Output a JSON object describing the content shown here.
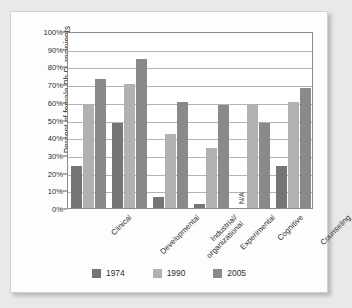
{
  "chart_data": {
    "type": "bar",
    "title": "",
    "xlabel": "",
    "ylabel": "Percent of female Ph.D. recipients",
    "ylim": [
      0,
      100
    ],
    "ytick_labels": [
      "100%",
      "90%",
      "80%",
      "70%",
      "60%",
      "50%",
      "40%",
      "30%",
      "20%",
      "10%",
      "0%"
    ],
    "ytick_values": [
      100,
      90,
      80,
      70,
      60,
      50,
      40,
      30,
      20,
      10,
      0
    ],
    "grid": true,
    "legend_position": "bottom",
    "categories": [
      "Clinical",
      "Developmental",
      "Industrial/\norganizational",
      "Experimental",
      "Cognitive",
      "Counseling"
    ],
    "category_lines": [
      [
        "Clinical"
      ],
      [
        "Developmental"
      ],
      [
        "Industrial/",
        "organizational"
      ],
      [
        "Experimental"
      ],
      [
        "Cognitive"
      ],
      [
        "Counseling"
      ]
    ],
    "series": [
      {
        "name": "1974",
        "color": "#757575",
        "values": [
          24,
          48,
          6,
          2,
          null,
          24
        ]
      },
      {
        "name": "1990",
        "color": "#b1b1b1",
        "values": [
          58,
          70,
          42,
          34,
          59,
          60
        ]
      },
      {
        "name": "2005",
        "color": "#8a8a8a",
        "values": [
          73,
          84,
          60,
          58,
          48,
          68
        ]
      }
    ],
    "annotations": [
      {
        "text": "N/A",
        "category": "Cognitive",
        "series": "1974",
        "orientation": "vertical"
      }
    ]
  },
  "legend": {
    "items": [
      {
        "label": "1974",
        "color": "#757575"
      },
      {
        "label": "1990",
        "color": "#b1b1b1"
      },
      {
        "label": "2005",
        "color": "#8a8a8a"
      }
    ]
  }
}
